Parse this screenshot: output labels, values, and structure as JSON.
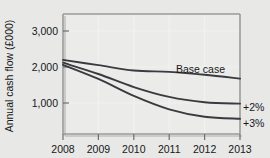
{
  "chart_data": {
    "type": "line",
    "title": "",
    "xlabel": "",
    "ylabel": "Annual cash flow (£000)",
    "categories": [
      "2008",
      "2009",
      "2010",
      "2011",
      "2012",
      "2013"
    ],
    "x": [
      2008,
      2009,
      2010,
      2011,
      2012,
      2013
    ],
    "xlim": [
      2008,
      2013
    ],
    "ylim": [
      0,
      3400
    ],
    "yticks": [
      "1,000",
      "2,000",
      "3,000"
    ],
    "ytick_values": [
      1000,
      2000,
      3000
    ],
    "grid": true,
    "legend_position": "inline-right",
    "series": [
      {
        "name": "Base case",
        "label": "Base case",
        "values": [
          2100,
          1950,
          1800,
          1760,
          1680,
          1570
        ]
      },
      {
        "name": "+2%",
        "label": "+2%",
        "values": [
          2020,
          1700,
          1330,
          1050,
          900,
          860
        ]
      },
      {
        "name": "+3%",
        "label": "+3%",
        "values": [
          1960,
          1560,
          1080,
          700,
          490,
          430
        ]
      }
    ]
  },
  "axis": {
    "y_title": "Annual cash flow (£000)",
    "y_ticks": [
      {
        "label": "3,000",
        "value": 3000
      },
      {
        "label": "2,000",
        "value": 2000
      },
      {
        "label": "1,000",
        "value": 1000
      }
    ],
    "x_ticks": [
      {
        "label": "2008",
        "value": 2008
      },
      {
        "label": "2009",
        "value": 2009
      },
      {
        "label": "2010",
        "value": 2010
      },
      {
        "label": "2011",
        "value": 2011
      },
      {
        "label": "2012",
        "value": 2012
      },
      {
        "label": "2013",
        "value": 2013
      }
    ]
  },
  "annotations": {
    "base_case": "Base case",
    "plus_two": "+2%",
    "plus_three": "+3%"
  },
  "colors": {
    "background": "#e8e8e6",
    "plot_background": "#ebebe9",
    "curve": "#3a3a40",
    "grid": "#f2f2f0",
    "frame": "#9a9a98",
    "text": "#17171a"
  }
}
